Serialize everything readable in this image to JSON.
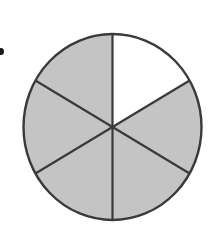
{
  "diagram": {
    "type": "fraction-circle",
    "total_parts": 6,
    "shaded_parts": 5,
    "unshaded_parts": 1,
    "fraction_shaded": "5/6",
    "unshaded_sector_position": "top-right",
    "colors": {
      "shaded": "#c4c4c4",
      "unshaded": "#ffffff",
      "outline": "#3a3a3a",
      "bullet": "#1a1a1a"
    }
  }
}
